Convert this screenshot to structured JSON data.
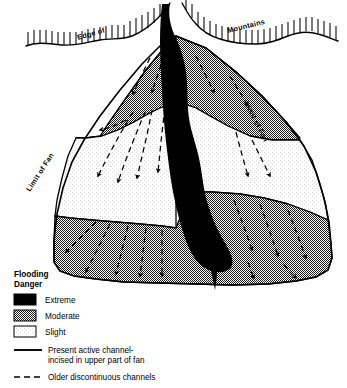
{
  "figure": {
    "type": "alluvial-fan-flood-hazard-map",
    "map_labels": [
      {
        "id": "edge-of",
        "text": "Edge of"
      },
      {
        "id": "mountains",
        "text": "Mountains"
      },
      {
        "id": "limit-of-fan-left",
        "text": "Limit of Fan"
      },
      {
        "id": "limit-of-fan-right",
        "text": "Limit of Fan"
      }
    ]
  },
  "legend": {
    "title_line1": "Flooding",
    "title_line2": "Danger",
    "swatches": [
      {
        "id": "extreme",
        "label": "Extreme",
        "color": "#000000",
        "fill": "solid-black"
      },
      {
        "id": "moderate",
        "label": "Moderate",
        "color": "#808080",
        "fill": "gray-stipple"
      },
      {
        "id": "slight",
        "label": "Slight",
        "color": "#f2f2f2",
        "fill": "light-stipple"
      }
    ],
    "lines": [
      {
        "id": "present-active-channel",
        "style": "solid",
        "label_line1": "Present active channel-",
        "label_line2": "incised in upper part of fan"
      },
      {
        "id": "older-discontinuous-channels",
        "style": "dashed",
        "label_line1": "Older discontinuous channels",
        "label_line2": ""
      }
    ]
  },
  "colors": {
    "extreme": "#000000",
    "moderate": "#808080",
    "slight": "#f2f2f2",
    "outline": "#000000",
    "background": "#ffffff"
  }
}
